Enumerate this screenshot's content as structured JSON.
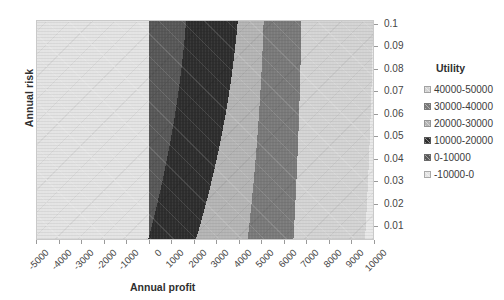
{
  "chart_data": {
    "type": "heatmap",
    "title": "",
    "subtitle": "",
    "xlabel": "Annual profit",
    "ylabel": "Annual risk",
    "legend_title": "Utility",
    "legend_position": "right",
    "grid": false,
    "x_tick_labels": [
      "-5000",
      "-4000",
      "-3000",
      "-2000",
      "-1000",
      "0",
      "1000",
      "2000",
      "3000",
      "4000",
      "5000",
      "6000",
      "7000",
      "8000",
      "9000",
      "10000"
    ],
    "x_values": [
      -5000,
      -4000,
      -3000,
      -2000,
      -1000,
      0,
      1000,
      2000,
      3000,
      4000,
      5000,
      6000,
      7000,
      8000,
      9000,
      10000
    ],
    "xlim": [
      -5000,
      10000
    ],
    "y_tick_labels": [
      "0.1",
      "0.09",
      "0.08",
      "0.07",
      "0.06",
      "0.05",
      "0.04",
      "0.03",
      "0.02",
      "0.01"
    ],
    "y_values": [
      0.1,
      0.09,
      0.08,
      0.07,
      0.06,
      0.05,
      0.04,
      0.03,
      0.02,
      0.01
    ],
    "ylim": [
      0.01,
      0.1
    ],
    "y_axis_side": "right",
    "y_axis_direction": "descending-downward",
    "bands": [
      {
        "label": "40000-50000",
        "color": "#d4d4d4",
        "index": 0
      },
      {
        "label": "30000-40000",
        "color": "#7a7a7a",
        "index": 1
      },
      {
        "label": "20000-30000",
        "color": "#b5b5b5",
        "index": 2
      },
      {
        "label": "10000-20000",
        "color": "#2e2e2e",
        "index": 3
      },
      {
        "label": "0-10000",
        "color": "#585858",
        "index": 4
      },
      {
        "label": "-10000-0",
        "color": "#e4e4e4",
        "index": 5
      }
    ],
    "regions": [
      {
        "band": "-10000-0",
        "color": "#e4e4e4",
        "note": "uniform block spanning profit -5000 to 0, all risk levels"
      },
      {
        "band": "0-10000",
        "color": "#585858",
        "note": "first curved band right of profit 0, widening toward low risk"
      },
      {
        "band": "10000-20000",
        "color": "#2e2e2e",
        "note": "second curved band, darkest"
      },
      {
        "band": "20000-30000",
        "color": "#b5b5b5",
        "note": "third curved band, light gray"
      },
      {
        "band": "30000-40000",
        "color": "#7a7a7a",
        "note": "fourth curved band, mid gray"
      },
      {
        "band": "40000-50000",
        "color": "#d4d4d4",
        "note": "rightmost sliver at top-right / high profit, low risk"
      }
    ],
    "contour_boundaries_note": "Iso-utility boundaries run from lower-left to upper-right, steeper (more vertical) at high risk and fanning out toward low risk; band width increases as annual risk decreases."
  },
  "axes": {
    "x_title": "Annual profit",
    "y_title": "Annual risk"
  },
  "legend": {
    "title": "Utility",
    "items": [
      {
        "label": "40000-50000"
      },
      {
        "label": "30000-40000"
      },
      {
        "label": "20000-30000"
      },
      {
        "label": "10000-20000"
      },
      {
        "label": "0-10000"
      },
      {
        "label": "-10000-0"
      }
    ]
  }
}
